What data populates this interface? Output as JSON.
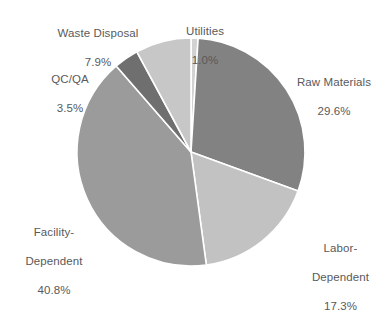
{
  "chart_data": {
    "type": "pie",
    "title": "",
    "subtitle": "",
    "xlabel": "",
    "ylabel": "",
    "legend_position": "none",
    "grid": false,
    "labels_outside": true,
    "start_angle_deg": 0,
    "direction": "clockwise",
    "categories": [
      "Utilities",
      "Raw Materials",
      "Labor-Dependent",
      "Facility-Dependent",
      "QC/QA",
      "Waste Disposal"
    ],
    "values": [
      1.0,
      29.6,
      17.3,
      40.8,
      3.5,
      7.9
    ],
    "unit": "%",
    "slices": [
      {
        "name": "Utilities",
        "label_line1": "Utilities",
        "label_line2": "",
        "percent_text": "1.0%",
        "value": 1.0,
        "color": "#d2d2d2"
      },
      {
        "name": "Raw Materials",
        "label_line1": "Raw Materials",
        "label_line2": "",
        "percent_text": "29.6%",
        "value": 29.6,
        "color": "#828282"
      },
      {
        "name": "Labor-Dependent",
        "label_line1": "Labor-",
        "label_line2": "Dependent",
        "percent_text": "17.3%",
        "value": 17.3,
        "color": "#c2c2c2"
      },
      {
        "name": "Facility-Dependent",
        "label_line1": "Facility-",
        "label_line2": "Dependent",
        "percent_text": "40.8%",
        "value": 40.8,
        "color": "#9b9b9b"
      },
      {
        "name": "QC/QA",
        "label_line1": "QC/QA",
        "label_line2": "",
        "percent_text": "3.5%",
        "value": 3.5,
        "color": "#6f6f6f"
      },
      {
        "name": "Waste Disposal",
        "label_line1": "Waste Disposal",
        "label_line2": "",
        "percent_text": "7.9%",
        "value": 7.9,
        "color": "#c7c7c7"
      }
    ],
    "geometry": {
      "center_x": 191,
      "center_y": 152,
      "radius": 114
    },
    "colors": {
      "background": "#ffffff",
      "label_text": "#59595b",
      "slice_separator": "#ffffff"
    }
  }
}
